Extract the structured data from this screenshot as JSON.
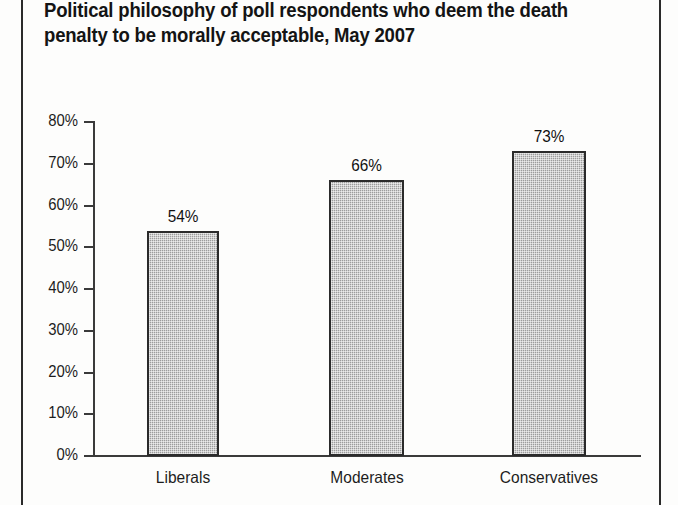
{
  "figure": {
    "title_line1": "Political philosophy of poll respondents who deem the death",
    "title_line2": "penalty to be morally acceptable, May 2007",
    "title_full": "Political philosophy of poll respondents who deem the death\npenalty to be morally acceptable, May 2007",
    "frame_color": "#2a2a2a",
    "background_color": "#fdfdfc"
  },
  "axis": {
    "y_tick_labels": [
      "80%",
      "70%",
      "60%",
      "50%",
      "40%",
      "30%",
      "20%",
      "10%",
      "0%"
    ],
    "y_tick_values": [
      80,
      70,
      60,
      50,
      40,
      30,
      20,
      10,
      0
    ],
    "axis_color": "#3a3a3a"
  },
  "bars": [
    {
      "category": "Liberals",
      "value": 54,
      "value_label": "54%"
    },
    {
      "category": "Moderates",
      "value": 66,
      "value_label": "66%"
    },
    {
      "category": "Conservatives",
      "value": 73,
      "value_label": "73%"
    }
  ],
  "style": {
    "bar_fill": "#a9a9a9",
    "bar_border": "#2b2b2b",
    "text_color": "#1d1d1d"
  },
  "chart_data": {
    "type": "bar",
    "title": "Political philosophy of poll respondents who deem the death penalty to be morally acceptable, May 2007",
    "subtitle": "",
    "xlabel": "",
    "ylabel": "",
    "categories": [
      "Liberals",
      "Moderates",
      "Conservatives"
    ],
    "values": [
      54,
      66,
      73
    ],
    "data_labels": [
      "54%",
      "66%",
      "73%"
    ],
    "ylim": [
      0,
      80
    ],
    "ytick_interval": 10,
    "ytick_labels": [
      "0%",
      "10%",
      "20%",
      "30%",
      "40%",
      "50%",
      "60%",
      "70%",
      "80%"
    ],
    "grid": false,
    "legend": false,
    "legend_position": "none",
    "units": "percent",
    "series": [
      {
        "name": "Deem death penalty morally acceptable",
        "values": [
          54,
          66,
          73
        ]
      }
    ]
  }
}
